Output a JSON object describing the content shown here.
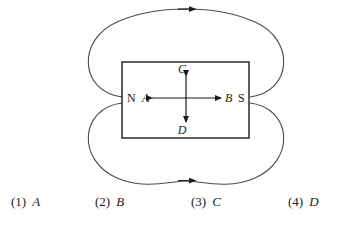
{
  "diagram": {
    "name": "bar-magnet-field-lines",
    "magnet": {
      "north_pole_label": "N",
      "south_pole_label": "S"
    },
    "direction_labels": {
      "left": "A",
      "right": "B",
      "up": "C",
      "down": "D"
    },
    "field_lines": {
      "top_loop_arrow_direction": "right",
      "bottom_loop_arrow_direction": "right",
      "count": 2
    },
    "colors": {
      "stroke": "#1a1a1a",
      "field_line": "#4a4a4a",
      "background": "#ffffff"
    }
  },
  "options": [
    {
      "number": "(1)",
      "value": "A"
    },
    {
      "number": "(2)",
      "value": "B"
    },
    {
      "number": "(3)",
      "value": "C"
    },
    {
      "number": "(4)",
      "value": "D"
    }
  ]
}
